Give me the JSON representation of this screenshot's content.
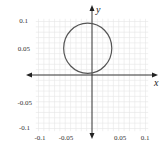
{
  "chart_data": {
    "type": "line",
    "title": "",
    "xlabel": "x",
    "ylabel": "y",
    "xlim": [
      -0.1,
      0.1
    ],
    "ylim": [
      -0.1,
      0.1
    ],
    "grid": true,
    "x_ticks": [
      "-0.1",
      "-0.05",
      "0.05",
      "0.1"
    ],
    "y_ticks": [
      "0.1",
      "0.05",
      "-0.05",
      "-0.1"
    ],
    "series": [
      {
        "name": "closed curve",
        "shape": "ellipse",
        "center": [
          -0.008,
          0.05
        ],
        "radius_x": 0.045,
        "radius_y": 0.047,
        "passes_through": [
          0,
          0
        ]
      }
    ],
    "legend": null
  }
}
